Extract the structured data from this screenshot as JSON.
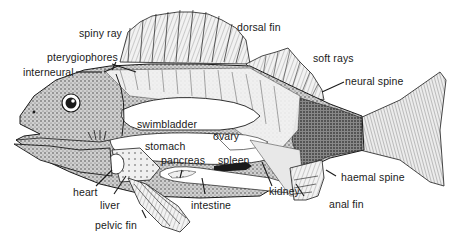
{
  "diagram": {
    "labels": {
      "spiny_ray": "spiny ray",
      "dorsal_fin": "dorsal fin",
      "pterygiophores": "pterygiophores",
      "interneural": "interneural",
      "soft_rays": "soft rays",
      "neural_spine": "neural spine",
      "swimbladder": "swimbladder",
      "ovary": "ovary",
      "stomach": "stomach",
      "pancreas": "pancreas",
      "spleen": "spleen",
      "heart": "heart",
      "liver": "liver",
      "intestine": "intestine",
      "kidney": "kidney",
      "haemal_spine": "haemal spine",
      "anal_fin": "anal fin",
      "pelvic_fin": "pelvic fin"
    },
    "colors": {
      "ink": "#1a1a1a",
      "fin_fill": "#e6e6e6",
      "body_fill": "#b8b8b8",
      "organ_fill": "#ffffff",
      "dark_fill": "#222222"
    }
  }
}
